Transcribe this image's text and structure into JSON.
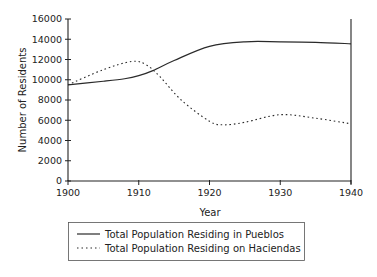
{
  "chart_data": {
    "type": "line",
    "title": "",
    "xlabel": "Year",
    "ylabel": "Number of Residents",
    "xlim": [
      1900,
      1940
    ],
    "ylim": [
      0,
      16000
    ],
    "x_ticks": [
      "1900",
      "1910",
      "1920",
      "1930",
      "1940"
    ],
    "y_ticks": [
      "0",
      "2000",
      "4000",
      "6000",
      "8000",
      "10000",
      "12000",
      "14000",
      "16000"
    ],
    "grid": false,
    "legend_position": "bottom",
    "series": [
      {
        "name": "Total Population Residing in Pueblos",
        "style": "solid",
        "x": [
          1900,
          1905,
          1908,
          1910,
          1912,
          1915,
          1920,
          1925,
          1930,
          1935,
          1940
        ],
        "values": [
          9500,
          9850,
          10100,
          10400,
          10900,
          11900,
          13300,
          13750,
          13750,
          13700,
          13550
        ]
      },
      {
        "name": "Total Population Residing on Haciendas",
        "style": "dotted",
        "x": [
          1900,
          1905,
          1909,
          1911,
          1913,
          1916,
          1920,
          1922,
          1925,
          1930,
          1935,
          1940
        ],
        "values": [
          9500,
          11000,
          11800,
          11500,
          10300,
          8000,
          5900,
          5550,
          5800,
          6550,
          6200,
          5650
        ]
      }
    ]
  },
  "colors": {
    "line": "#2a2a2a",
    "axis": "#222222",
    "background": "#ffffff"
  }
}
